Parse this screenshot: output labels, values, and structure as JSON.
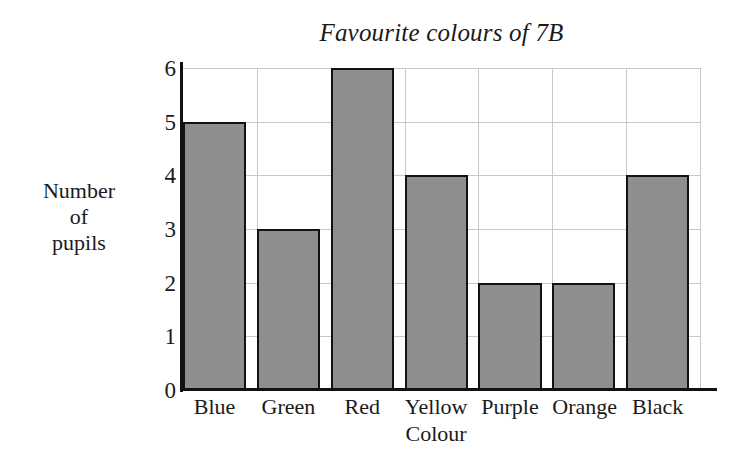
{
  "chart_data": {
    "type": "bar",
    "title": "Favourite colours of 7B",
    "xlabel": "Colour",
    "ylabel": "Number of pupils",
    "ylabel_lines": [
      "Number",
      "of",
      "pupils"
    ],
    "categories": [
      "Blue",
      "Green",
      "Red",
      "Yellow",
      "Purple",
      "Orange",
      "Black"
    ],
    "values": [
      5,
      3,
      6,
      4,
      2,
      2,
      4
    ],
    "yticks": [
      0,
      1,
      2,
      3,
      4,
      5,
      6
    ],
    "ylim": [
      0,
      6
    ],
    "grid": true,
    "legend": false,
    "bar_fill_color": "#8e8e8e",
    "bar_edge_color": "#121212",
    "gridline_color": "#c9c9c9",
    "axis_color": "#111111",
    "background_color": "#ffffff"
  }
}
